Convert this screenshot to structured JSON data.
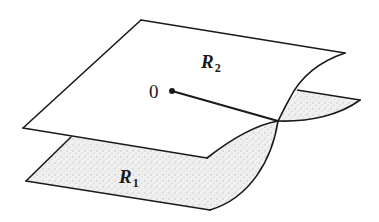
{
  "figure": {
    "labels": {
      "upper_sheet": {
        "base": "R",
        "subscript": "2"
      },
      "lower_sheet": {
        "base": "R",
        "subscript": "1"
      },
      "origin": "0"
    },
    "colors": {
      "stroke": "#1a1a1a",
      "upper_fill": "#ffffff",
      "lower_fill_stipple": "#d8d8d8"
    },
    "elements": [
      "upper sheet R2 (white parallelogram with curled right edge)",
      "lower sheet R1 (stippled, partially hidden below R2)",
      "branch point 0 (filled dot)",
      "branch cut (line from 0 to the crossing of the two sheets)"
    ]
  }
}
